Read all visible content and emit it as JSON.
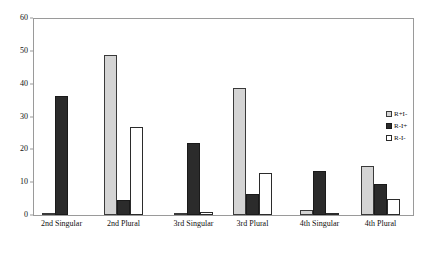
{
  "chart_data": {
    "type": "bar",
    "title": "",
    "subtitle": "",
    "xlabel": "",
    "ylabel": "",
    "ylim": [
      0,
      60
    ],
    "yticks": [
      0,
      10,
      20,
      30,
      40,
      50,
      60
    ],
    "grid": false,
    "legend_position": "right",
    "categories": [
      "2nd Singular",
      "2nd Plural",
      "3rd Singular",
      "3rd Plural",
      "4th Singular",
      "4th Plural"
    ],
    "series": [
      {
        "name": "R+I-",
        "color": "#d4d4d4",
        "values": [
          0.5,
          49,
          0.5,
          39,
          1.5,
          15
        ]
      },
      {
        "name": "R-I+",
        "color": "#2b2b2b",
        "values": [
          36.5,
          4.5,
          22,
          6.5,
          13.5,
          9.5
        ]
      },
      {
        "name": "R-I-",
        "color": "#ffffff",
        "values": [
          0,
          27,
          1,
          13,
          0.5,
          5
        ]
      }
    ]
  },
  "legend": {
    "items": [
      {
        "label": "R+I-",
        "swatch": "legend-swatch-light-gray"
      },
      {
        "label": "R-I+",
        "swatch": "legend-swatch-dark"
      },
      {
        "label": "R-I-",
        "swatch": "legend-swatch-white"
      }
    ]
  }
}
